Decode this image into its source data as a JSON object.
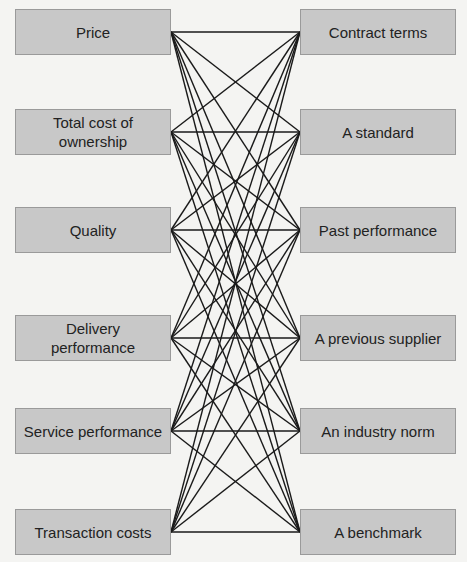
{
  "diagram": {
    "type": "complete-bipartite-connection",
    "left_nodes": [
      {
        "label": "Price"
      },
      {
        "label": "Total cost of ownership"
      },
      {
        "label": "Quality"
      },
      {
        "label": "Delivery performance"
      },
      {
        "label": "Service performance"
      },
      {
        "label": "Transaction costs"
      }
    ],
    "right_nodes": [
      {
        "label": "Contract terms"
      },
      {
        "label": "A standard"
      },
      {
        "label": "Past performance"
      },
      {
        "label": "A previous supplier"
      },
      {
        "label": "An industry norm"
      },
      {
        "label": "A benchmark"
      }
    ],
    "edges": "every left node connected to every right node",
    "colors": {
      "box_fill": "#c8c8c8",
      "box_border": "#9a9a9a",
      "line": "#1a1a1a",
      "background": "#f4f4f2"
    }
  }
}
